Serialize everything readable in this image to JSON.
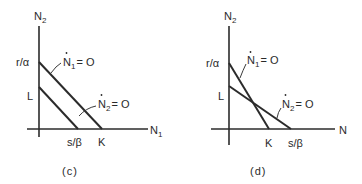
{
  "panels": [
    {
      "id": "c",
      "caption": "(c)",
      "y_axis_label": "N",
      "y_axis_sub": "2",
      "x_axis_label": "N",
      "x_axis_sub": "1",
      "y_intercepts": {
        "upper": "r/α",
        "lower": "L"
      },
      "x_intercepts": {
        "left": "s/β",
        "right": "K"
      },
      "isocline_1": {
        "label_main": "N",
        "label_sub": "1",
        "label_rest": "= O",
        "dot": "•"
      },
      "isocline_2": {
        "label_main": "N",
        "label_sub": "2",
        "label_rest": "= O",
        "dot": "•"
      }
    },
    {
      "id": "d",
      "caption": "(d)",
      "y_axis_label": "N",
      "y_axis_sub": "2",
      "x_axis_label": "N",
      "x_axis_sub": "",
      "y_intercepts": {
        "upper": "r/α",
        "lower": "L"
      },
      "x_intercepts": {
        "left": "K",
        "right": "s/β"
      },
      "isocline_1": {
        "label_main": "N",
        "label_sub": "1",
        "label_rest": "= O",
        "dot": "•"
      },
      "isocline_2": {
        "label_main": "N",
        "label_sub": "2",
        "label_rest": "= O",
        "dot": "•"
      }
    }
  ]
}
